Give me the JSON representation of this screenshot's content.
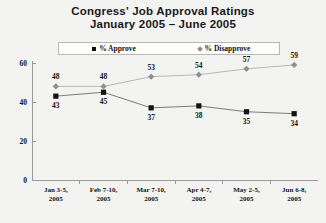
{
  "chart_data": {
    "type": "line",
    "title": "Congress' Job Approval Ratings",
    "subtitle": "January 2005 – June 2005",
    "xlabel": "",
    "ylabel": "",
    "ylim": [
      0,
      60
    ],
    "yticks": [
      0,
      20,
      40,
      60
    ],
    "grid": false,
    "legend_position": "top-center",
    "categories": [
      "Jan 3-5, 2005",
      "Feb 7-10, 2005",
      "Mar 7-10, 2005",
      "Apr 4-7, 2005",
      "May 2-5, 2005",
      "Jun 6-8, 2005"
    ],
    "category_lines": [
      [
        "Jan 3-5,",
        "2005"
      ],
      [
        "Feb 7-10,",
        "2005"
      ],
      [
        "Mar 7-10,",
        "2005"
      ],
      [
        "Apr 4-7,",
        "2005"
      ],
      [
        "May 2-5,",
        "2005"
      ],
      [
        "Jun 6-8,",
        "2005"
      ]
    ],
    "series": [
      {
        "name": "% Approve",
        "marker": "square",
        "color": "#121212",
        "label_position": "below",
        "values": [
          43,
          45,
          37,
          38,
          35,
          34
        ]
      },
      {
        "name": "% Disapprove",
        "marker": "diamond",
        "color": "#8f8f8f",
        "label_position": "above",
        "values": [
          48,
          48,
          53,
          54,
          57,
          59
        ]
      }
    ]
  },
  "legend": {
    "items": [
      {
        "label": "% Approve",
        "marker": "square"
      },
      {
        "label": "% Disapprove",
        "marker": "diamond"
      }
    ]
  },
  "title": {
    "line1": "Congress' Job Approval Ratings",
    "line2": "January 2005 – June 2005"
  }
}
